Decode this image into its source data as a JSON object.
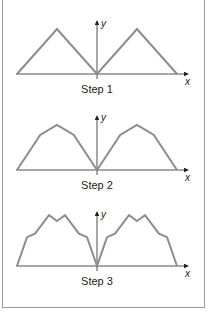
{
  "figure": {
    "panels": [
      {
        "caption": "Step 1",
        "x_label": "x",
        "y_label": "y"
      },
      {
        "caption": "Step 2",
        "x_label": "x",
        "y_label": "y"
      },
      {
        "caption": "Step 3",
        "x_label": "x",
        "y_label": "y"
      }
    ],
    "colors": {
      "curve": "#8c8c8c",
      "axis": "#222222",
      "frame": "#9a9a9a"
    }
  },
  "shapes": {
    "step1": [
      [
        -2,
        0
      ],
      [
        -1,
        1
      ],
      [
        0,
        0
      ],
      [
        1,
        1
      ],
      [
        2,
        0
      ]
    ],
    "step2": [
      [
        -2,
        0
      ],
      [
        -1.42,
        0.78
      ],
      [
        -1,
        1
      ],
      [
        -0.58,
        0.78
      ],
      [
        0,
        0
      ],
      [
        0.58,
        0.78
      ],
      [
        1,
        1
      ],
      [
        1.42,
        0.78
      ],
      [
        2,
        0
      ]
    ],
    "step3": [
      [
        -2,
        0
      ],
      [
        -1.75,
        0.64
      ],
      [
        -1.55,
        0.72
      ],
      [
        -1.2,
        1.13
      ],
      [
        -1,
        1
      ],
      [
        -0.8,
        1.13
      ],
      [
        -0.45,
        0.72
      ],
      [
        -0.25,
        0.64
      ],
      [
        0,
        0
      ],
      [
        0.25,
        0.64
      ],
      [
        0.45,
        0.72
      ],
      [
        0.8,
        1.13
      ],
      [
        1,
        1
      ],
      [
        1.2,
        1.13
      ],
      [
        1.55,
        0.72
      ],
      [
        1.75,
        0.64
      ],
      [
        2,
        0
      ]
    ]
  }
}
